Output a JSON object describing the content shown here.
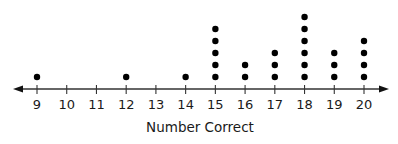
{
  "chart_data": {
    "type": "dot",
    "title": "",
    "xlabel": "Number Correct",
    "ylabel": "",
    "categories": [
      9,
      10,
      11,
      12,
      13,
      14,
      15,
      16,
      17,
      18,
      19,
      20
    ],
    "values": [
      1,
      0,
      0,
      1,
      0,
      1,
      5,
      2,
      3,
      6,
      3,
      4
    ],
    "xlim": [
      9,
      20
    ],
    "grid": false,
    "legend": null,
    "axis_arrows": "both",
    "dot_color": "#000000"
  }
}
